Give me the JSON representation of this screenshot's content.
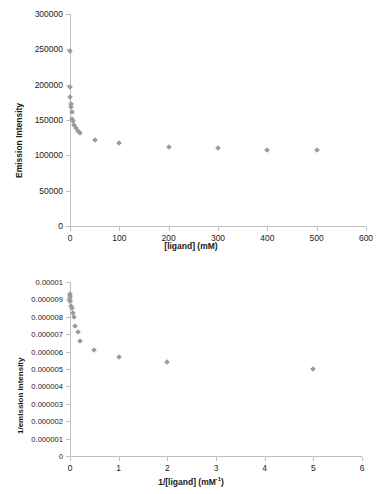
{
  "chart_data": [
    {
      "id": "emission-vs-ligand",
      "type": "scatter",
      "title": "",
      "xlabel": "[ligand] (mM)",
      "ylabel": "Emission Intensity",
      "xlim": [
        0,
        600
      ],
      "ylim": [
        0,
        300000
      ],
      "xticks": [
        0,
        100,
        200,
        300,
        400,
        500,
        600
      ],
      "xticklabels": [
        "0",
        "100",
        "200",
        "300",
        "400",
        "500",
        "600"
      ],
      "yticks": [
        0,
        50000,
        100000,
        150000,
        200000,
        250000,
        300000
      ],
      "yticklabels": [
        "0",
        "50000",
        "100000",
        "150000",
        "200000",
        "250000",
        "300000"
      ],
      "grid": false,
      "legend": false,
      "marker": "diamond",
      "marker_color": "#9b9b9b",
      "points": [
        {
          "x": 0,
          "y": 248000
        },
        {
          "x": 0.5,
          "y": 196000
        },
        {
          "x": 1,
          "y": 182000
        },
        {
          "x": 2,
          "y": 172000
        },
        {
          "x": 3,
          "y": 168000
        },
        {
          "x": 4,
          "y": 161000
        },
        {
          "x": 5,
          "y": 152000
        },
        {
          "x": 6,
          "y": 149000
        },
        {
          "x": 9,
          "y": 143000
        },
        {
          "x": 12,
          "y": 138000
        },
        {
          "x": 16,
          "y": 134000
        },
        {
          "x": 20,
          "y": 131000
        },
        {
          "x": 50,
          "y": 122000
        },
        {
          "x": 100,
          "y": 117000
        },
        {
          "x": 200,
          "y": 112000
        },
        {
          "x": 300,
          "y": 110000
        },
        {
          "x": 400,
          "y": 108000
        },
        {
          "x": 500,
          "y": 107000
        }
      ]
    },
    {
      "id": "lineweaver-burk",
      "type": "scatter",
      "title": "",
      "xlabel": "1/[ligand] (mM⁻¹)",
      "xlabel_base": "1/[ligand] (mM",
      "xlabel_sup": "-1",
      "xlabel_tail": ")",
      "ylabel": "1/emission intensity",
      "xlim": [
        0,
        6
      ],
      "ylim": [
        0,
        1e-05
      ],
      "xticks": [
        0,
        1,
        2,
        3,
        4,
        5,
        6
      ],
      "xticklabels": [
        "0",
        "1",
        "2",
        "3",
        "4",
        "5",
        "6"
      ],
      "yticks": [
        0,
        1e-06,
        2e-06,
        3e-06,
        4e-06,
        5e-06,
        6e-06,
        7e-06,
        8e-06,
        9e-06,
        1e-05
      ],
      "yticklabels": [
        "0",
        "0.000001",
        "0.000002",
        "0.000003",
        "0.000004",
        "0.000005",
        "0.000006",
        "0.000007",
        "0.000008",
        "0.000009",
        "0.00001"
      ],
      "grid": false,
      "legend": false,
      "marker": "diamond",
      "marker_color": "#9b9b9b",
      "points": [
        {
          "x": 0.002,
          "y": 9.3e-06
        },
        {
          "x": 0.0025,
          "y": 9.2e-06
        },
        {
          "x": 0.0033,
          "y": 9.1e-06
        },
        {
          "x": 0.005,
          "y": 8.9e-06
        },
        {
          "x": 0.01,
          "y": 8.9e-06
        },
        {
          "x": 0.02,
          "y": 8.6e-06
        },
        {
          "x": 0.05,
          "y": 8.5e-06
        },
        {
          "x": 0.0625,
          "y": 8.2e-06
        },
        {
          "x": 0.083,
          "y": 8e-06
        },
        {
          "x": 0.111,
          "y": 7.5e-06
        },
        {
          "x": 0.167,
          "y": 7.1e-06
        },
        {
          "x": 0.2,
          "y": 6.6e-06
        },
        {
          "x": 0.5,
          "y": 6.1e-06
        },
        {
          "x": 1.0,
          "y": 5.7e-06
        },
        {
          "x": 2.0,
          "y": 5.4e-06
        },
        {
          "x": 5.0,
          "y": 5e-06
        }
      ]
    }
  ]
}
